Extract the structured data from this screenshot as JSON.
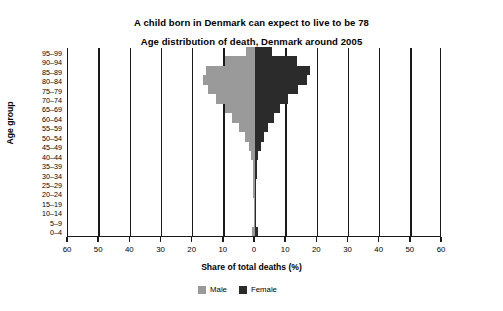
{
  "titles": {
    "main": "A child born in Denmark can expect to live to be 78",
    "sub": "Age distribution of death, Denmark around 2005"
  },
  "axes": {
    "ytitle": "Age group",
    "xtitle": "Share of total deaths (%)"
  },
  "legend": {
    "male_label": "Male",
    "female_label": "Female",
    "male_color": "#9a9a9a",
    "female_color": "#2b2b2b"
  },
  "chart_data": {
    "type": "bar",
    "subtype": "population-pyramid",
    "title": "A child born in Denmark can expect to live to be 78",
    "subtitle": "Age distribution of death, Denmark around 2005",
    "xlabel": "Share of total deaths (%)",
    "ylabel": "Age group",
    "xlim": [
      -60,
      60
    ],
    "xticks": [
      60,
      50,
      40,
      30,
      20,
      10,
      0,
      10,
      20,
      30,
      40,
      50,
      60
    ],
    "xtick_labels": [
      "60",
      "50",
      "40",
      "30",
      "20",
      "10",
      "0",
      "10",
      "20",
      "30",
      "40",
      "50",
      "60"
    ],
    "grid": true,
    "legend_position": "bottom-right",
    "categories": [
      "0–4",
      "5–9",
      "10–14",
      "15–19",
      "20–24",
      "25–29",
      "30–34",
      "35–39",
      "40–44",
      "45–49",
      "50–54",
      "55–59",
      "60–64",
      "65–69",
      "70–74",
      "75–79",
      "80–84",
      "85–89",
      "90–94",
      "95–99"
    ],
    "series": [
      {
        "name": "Male",
        "side": "left",
        "color": "#9a9a9a",
        "values": [
          1.0,
          0.2,
          0.2,
          0.4,
          0.5,
          0.5,
          0.6,
          0.8,
          1.2,
          2.0,
          3.2,
          5.0,
          7.4,
          9.6,
          12.4,
          15.0,
          16.6,
          15.6,
          9.6,
          3.0
        ]
      },
      {
        "name": "Female",
        "side": "right",
        "color": "#2b2b2b",
        "values": [
          1.0,
          0.2,
          0.2,
          0.3,
          0.4,
          0.4,
          0.5,
          0.7,
          1.1,
          1.8,
          2.8,
          4.2,
          6.0,
          8.0,
          10.6,
          13.8,
          16.8,
          17.6,
          13.4,
          5.6
        ]
      }
    ]
  }
}
